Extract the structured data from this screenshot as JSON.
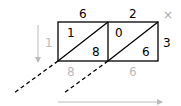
{
  "diagram": {
    "type": "lattice-multiplication",
    "multiplicand_digits": [
      "6",
      "2"
    ],
    "multiplier_digit": "3",
    "operator": "×",
    "cells": [
      {
        "upper": "1",
        "lower": "8"
      },
      {
        "upper": "0",
        "lower": "6"
      }
    ],
    "left_result_digit": "1",
    "bottom_result_digits": [
      "8",
      "6"
    ],
    "colors": {
      "grid": "#000000",
      "muted": "#bbbbbb",
      "operator": "#aaaaaa"
    }
  }
}
